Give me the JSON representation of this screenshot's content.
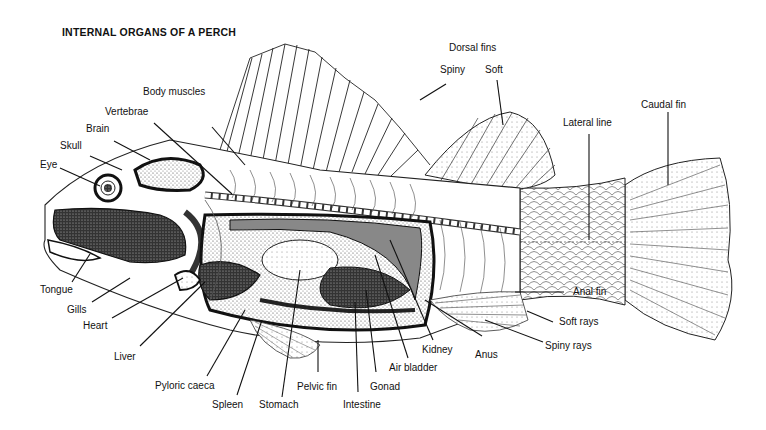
{
  "title": "INTERNAL ORGANS OF A PERCH",
  "labels": {
    "body_muscles": "Body muscles",
    "vertebrae": "Vertebrae",
    "brain": "Brain",
    "skull": "Skull",
    "eye": "Eye",
    "dorsal_fins": "Dorsal fins",
    "spiny": "Spiny",
    "soft": "Soft",
    "lateral_line": "Lateral line",
    "caudal_fin": "Caudal fin",
    "tongue": "Tongue",
    "gills": "Gills",
    "heart": "Heart",
    "liver": "Liver",
    "pyloric_caeca": "Pyloric caeca",
    "spleen": "Spleen",
    "stomach": "Stomach",
    "pelvic_fin": "Pelvic fin",
    "intestine": "Intestine",
    "gonad": "Gonad",
    "air_bladder": "Air bladder",
    "kidney": "Kidney",
    "anus": "Anus",
    "anal_fin": "Anal fin",
    "soft_rays": "Soft rays",
    "spiny_rays": "Spiny rays"
  },
  "colors": {
    "ink": "#111111",
    "background": "#ffffff",
    "stipple": "#555555"
  }
}
